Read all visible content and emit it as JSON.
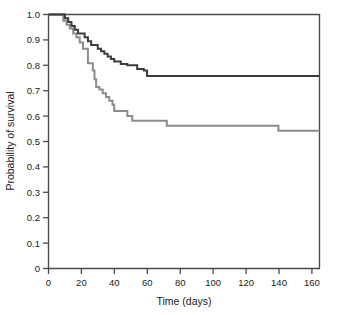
{
  "figure": {
    "width": 337,
    "height": 315,
    "background": "#ffffff"
  },
  "chart_data": {
    "type": "line",
    "subtype": "kaplan-meier-step",
    "title": "",
    "xlabel": "Time (days)",
    "ylabel": "Probability of survival",
    "xlim": [
      0,
      165
    ],
    "ylim": [
      0,
      1.0
    ],
    "xticks": [
      0,
      20,
      40,
      60,
      80,
      100,
      120,
      140,
      160
    ],
    "xtick_labels": [
      "0",
      "20",
      "40",
      "60",
      "80",
      "100",
      "120",
      "140",
      "160"
    ],
    "yticks": [
      0,
      0.1,
      0.2,
      0.3,
      0.4,
      0.5,
      0.6,
      0.7,
      0.8,
      0.9,
      1.0
    ],
    "ytick_labels": [
      "0",
      "0.1",
      "0.2",
      "0.3",
      "0.4",
      "0.5",
      "0.6",
      "0.7",
      "0.8",
      "0.9",
      "1.0"
    ],
    "grid": false,
    "legend": "none",
    "frame": "box-open-top-right",
    "series": [
      {
        "name": "upper-curve",
        "color": "#3c3c3c",
        "linewidth": 2.0,
        "step": "post",
        "x": [
          0,
          8,
          10,
          12,
          14,
          16,
          18,
          20,
          22,
          24,
          26,
          28,
          30,
          32,
          34,
          36,
          38,
          40,
          44,
          48,
          51,
          54,
          58,
          60,
          165
        ],
        "y": [
          1.0,
          1.0,
          0.985,
          0.97,
          0.955,
          0.94,
          0.925,
          0.925,
          0.91,
          0.895,
          0.88,
          0.88,
          0.865,
          0.855,
          0.845,
          0.835,
          0.825,
          0.815,
          0.805,
          0.8,
          0.8,
          0.785,
          0.78,
          0.758,
          0.758
        ],
        "final_value": 0.758
      },
      {
        "name": "lower-curve",
        "color": "#8c8c8c",
        "linewidth": 2.0,
        "step": "post",
        "x": [
          0,
          7,
          9,
          11,
          13,
          15,
          17,
          19,
          21,
          24,
          26,
          27,
          28,
          29,
          31,
          33,
          35,
          37,
          39,
          40,
          44,
          48,
          51,
          72,
          140,
          165
        ],
        "y": [
          1.0,
          1.0,
          0.975,
          0.96,
          0.945,
          0.925,
          0.91,
          0.89,
          0.865,
          0.808,
          0.808,
          0.78,
          0.745,
          0.715,
          0.705,
          0.69,
          0.675,
          0.66,
          0.645,
          0.62,
          0.62,
          0.6,
          0.582,
          0.562,
          0.542,
          0.542
        ],
        "final_value": 0.542
      }
    ]
  },
  "axes": {
    "x_axis_label": "Time (days)",
    "y_axis_label": "Probability of survival",
    "x_tick_labels": [
      "0",
      "20",
      "40",
      "60",
      "80",
      "100",
      "120",
      "140",
      "160"
    ],
    "y_tick_labels": [
      "1.0",
      "0.9",
      "0.8",
      "0.7",
      "0.6",
      "0.5",
      "0.4",
      "0.3",
      "0.2",
      "0.1",
      "0"
    ],
    "axis_color": "#4a4a4a"
  },
  "colors": {
    "upper_series": "#3c3c3c",
    "lower_series": "#8c8c8c",
    "axis": "#4a4a4a",
    "text": "#1a1a1a",
    "background": "#ffffff"
  }
}
